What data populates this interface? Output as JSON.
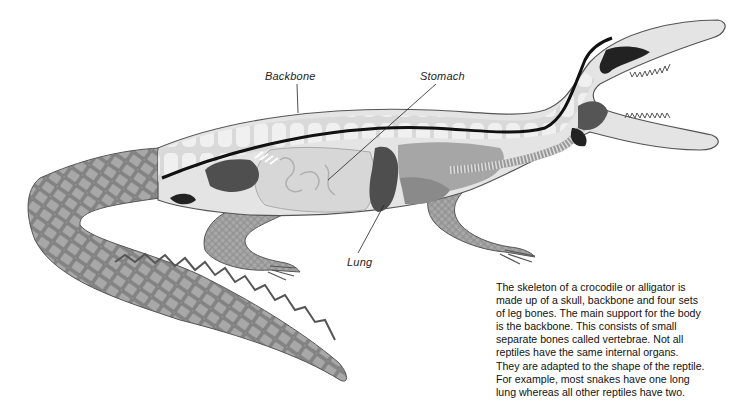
{
  "diagram": {
    "labels": {
      "backbone": "Backbone",
      "stomach": "Stomach",
      "lung": "Lung"
    },
    "caption_lines": [
      "The skeleton of a crocodile or alligator is",
      "made up of a skull, backbone and four sets",
      "of leg bones. The main support for the body",
      "is the backbone. This consists of small",
      "separate bones called vertebrae. Not all",
      "reptiles have the same internal organs.",
      "They are adapted to the shape of the reptile.",
      "For example, most snakes have one long",
      "lung whereas all other reptiles have two."
    ],
    "colors": {
      "background": "#ffffff",
      "body_light": "#e6e6e6",
      "body_mid": "#bdbdbd",
      "organ_dark": "#4a4a4a",
      "spine_line": "#111111",
      "scales": "#8a8a8a"
    }
  }
}
